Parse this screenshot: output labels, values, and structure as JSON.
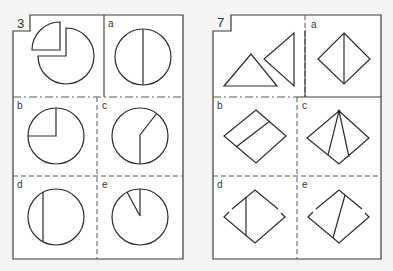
{
  "puzzles": [
    {
      "number": "3",
      "stimulus": "circle with a quarter sector cut out and displaced",
      "options": [
        {
          "label": "a",
          "figure": "circle with vertical diameter"
        },
        {
          "label": "b",
          "figure": "circle with upper-left quarter radii"
        },
        {
          "label": "c",
          "figure": "circle with bent radius line"
        },
        {
          "label": "d",
          "figure": "circle with off-center vertical chord"
        },
        {
          "label": "e",
          "figure": "circle with narrow sector near top"
        }
      ]
    },
    {
      "number": "7",
      "stimulus": "two triangles",
      "options": [
        {
          "label": "a",
          "figure": "diamond with vertical diagonal"
        },
        {
          "label": "b",
          "figure": "diamond with parallel line"
        },
        {
          "label": "c",
          "figure": "diamond with two lines from top"
        },
        {
          "label": "d",
          "figure": "diamond with vertical chord and broken sides"
        },
        {
          "label": "e",
          "figure": "diamond with slanted line and broken sides"
        }
      ]
    }
  ]
}
